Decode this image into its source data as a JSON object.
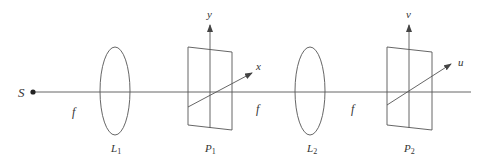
{
  "diagram": {
    "type": "optical-4f-system",
    "source": {
      "label": "S"
    },
    "focal_labels": [
      "f",
      "f",
      "f"
    ],
    "lenses": [
      {
        "label": "L",
        "sub": "1"
      },
      {
        "label": "L",
        "sub": "2"
      }
    ],
    "planes": [
      {
        "label": "P",
        "sub": "1",
        "axis_vertical": "y",
        "axis_oblique": "x"
      },
      {
        "label": "P",
        "sub": "2",
        "axis_vertical": "v",
        "axis_oblique": "u"
      }
    ],
    "colors": {
      "line": "#555555",
      "text": "#333333",
      "background": "#ffffff"
    }
  }
}
